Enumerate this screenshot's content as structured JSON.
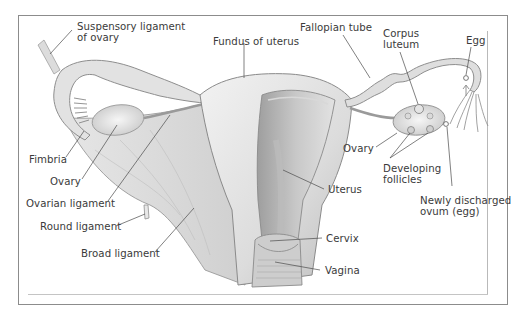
{
  "figure": {
    "colors": {
      "frame": "#8c8c8c",
      "label_text": "#3a3a3a",
      "leader_line": "#4a4a4a",
      "tissue_light": "#eeeeee",
      "tissue_mid": "#d4d4d4",
      "tissue_dark": "#a8a8a8"
    }
  },
  "labels": {
    "suspensory_ligament": {
      "line1": "Suspensory ligament",
      "line2": "of ovary"
    },
    "fundus_of_uterus": "Fundus of uterus",
    "fallopian_tube": "Fallopian tube",
    "corpus_luteum": {
      "line1": "Corpus",
      "line2": "luteum"
    },
    "egg": "Egg",
    "fimbria": "Fimbria",
    "ovary_left": "Ovary",
    "ovarian_ligament": "Ovarian ligament",
    "round_ligament": "Round ligament",
    "broad_ligament": "Broad ligament",
    "ovary_right": "Ovary",
    "developing_follicles": {
      "line1": "Developing",
      "line2": "follicles"
    },
    "uterus": "Uterus",
    "newly_discharged_ovum": {
      "line1": "Newly discharged",
      "line2": "ovum (egg)"
    },
    "cervix": "Cervix",
    "vagina": "Vagina"
  }
}
